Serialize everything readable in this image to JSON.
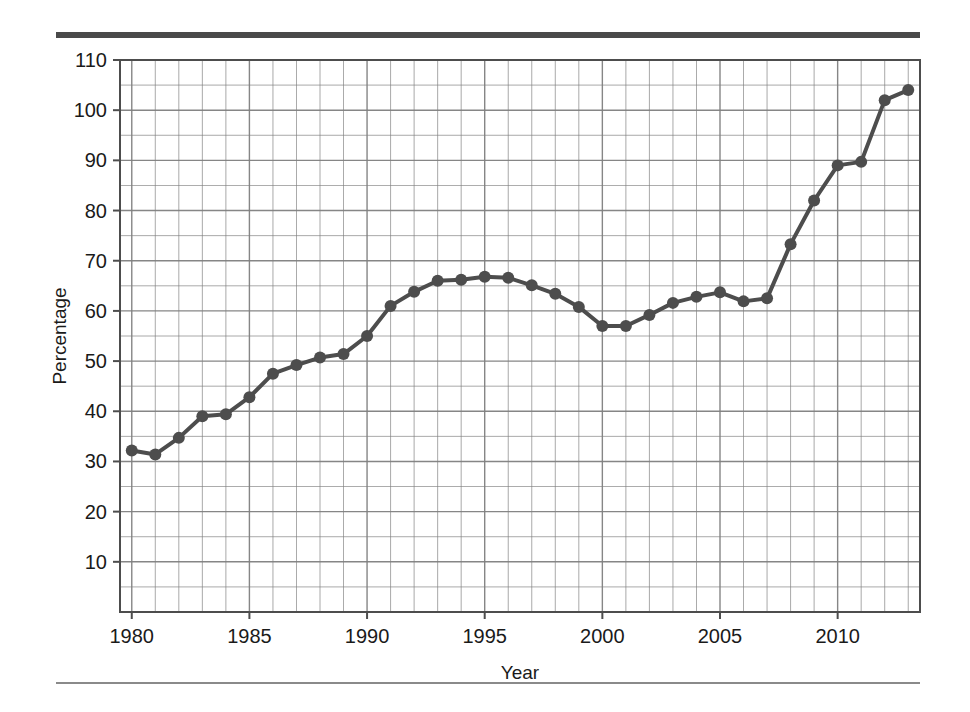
{
  "chart_data": {
    "type": "line",
    "title": "",
    "subtitle": "",
    "xlabel": "Year",
    "ylabel": "Percentage",
    "xlim": [
      1979.5,
      2013.5
    ],
    "ylim": [
      0,
      110
    ],
    "grid": true,
    "legend": null,
    "y_major_ticks": [
      10,
      20,
      30,
      40,
      50,
      60,
      70,
      80,
      90,
      100,
      110
    ],
    "y_tick_labels": [
      "10",
      "20",
      "30",
      "40",
      "50",
      "60",
      "70",
      "80",
      "90",
      "100",
      "110"
    ],
    "y_minor_step": 5,
    "x_major_ticks": [
      1980,
      1985,
      1990,
      1995,
      2000,
      2005,
      2010
    ],
    "x_tick_labels": [
      "1980",
      "1985",
      "1990",
      "1995",
      "2000",
      "2005",
      "2010"
    ],
    "x_minor_step": 1,
    "series_color": "#4d4d4d",
    "marker": "circle",
    "x": [
      1980,
      1981,
      1982,
      1983,
      1984,
      1985,
      1986,
      1987,
      1988,
      1989,
      1990,
      1991,
      1992,
      1993,
      1994,
      1995,
      1996,
      1997,
      1998,
      1999,
      2000,
      2001,
      2002,
      2003,
      2004,
      2005,
      2006,
      2007,
      2008,
      2009,
      2010,
      2011,
      2012,
      2013
    ],
    "values": [
      32.2,
      31.4,
      34.7,
      39.0,
      39.4,
      42.8,
      47.5,
      49.2,
      50.7,
      51.4,
      55.0,
      61.0,
      63.8,
      66.0,
      66.2,
      66.8,
      66.6,
      65.1,
      63.4,
      60.8,
      57.0,
      57.0,
      59.2,
      61.6,
      62.8,
      63.7,
      61.9,
      62.5,
      73.3,
      82.0,
      89.0,
      89.7,
      102.0,
      104.0
    ],
    "series": [
      {
        "name": "Percentage",
        "values": [
          32.2,
          31.4,
          34.7,
          39.0,
          39.4,
          42.8,
          47.5,
          49.2,
          50.7,
          51.4,
          55.0,
          61.0,
          63.8,
          66.0,
          66.2,
          66.8,
          66.6,
          65.1,
          63.4,
          60.8,
          57.0,
          57.0,
          59.2,
          61.6,
          62.8,
          63.7,
          61.9,
          62.5,
          73.3,
          82.0,
          89.0,
          89.7,
          102.0,
          104.0
        ]
      }
    ]
  },
  "figure": {
    "background_color": "#ffffff",
    "rule_color": "#4a4a4a",
    "grid_color": "#808080",
    "frame_color": "#4d4d4d"
  }
}
